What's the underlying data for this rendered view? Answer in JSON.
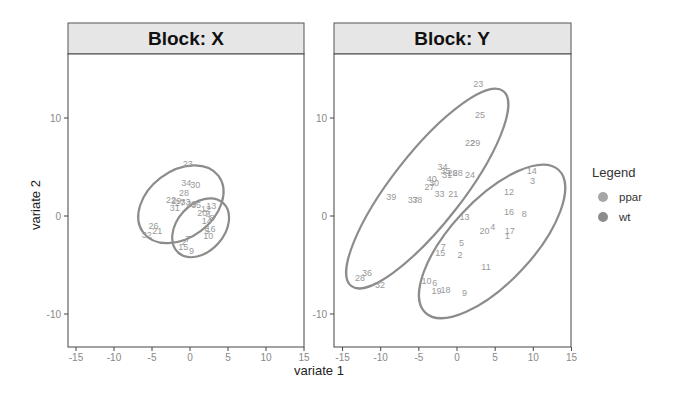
{
  "chart_data": [
    {
      "type": "scatter",
      "title": "Block: X",
      "xlabel": "variate 1",
      "ylabel": "variate 2",
      "xlim": [
        -15,
        15
      ],
      "ylim": [
        -13,
        16
      ],
      "xticks": [
        -15,
        -10,
        -5,
        0,
        5,
        10,
        15
      ],
      "yticks": [
        -10,
        0,
        10
      ],
      "grid": false,
      "series": [
        {
          "name": "ppar",
          "ellipse": {
            "cx": -1.2,
            "cy": 1.2,
            "rx": 6.2,
            "ry": 3.4,
            "angle_deg": -37
          },
          "points": [
            {
              "label": "23",
              "x": -0.3,
              "y": 5.3
            },
            {
              "label": "34",
              "x": -0.5,
              "y": 3.4
            },
            {
              "label": "30",
              "x": 0.7,
              "y": 3.2
            },
            {
              "label": "28",
              "x": -0.8,
              "y": 2.3
            },
            {
              "label": "22",
              "x": -2.5,
              "y": 1.6
            },
            {
              "label": "29",
              "x": -1.8,
              "y": 1.5
            },
            {
              "label": "27",
              "x": -1.3,
              "y": 1.3
            },
            {
              "label": "33",
              "x": -0.6,
              "y": 1.4
            },
            {
              "label": "39",
              "x": 0.2,
              "y": 1.2
            },
            {
              "label": "35",
              "x": 0.8,
              "y": 1.1
            },
            {
              "label": "31",
              "x": -2.0,
              "y": 0.8
            },
            {
              "label": "26",
              "x": -4.8,
              "y": -1.0
            },
            {
              "label": "21",
              "x": -4.3,
              "y": -1.5
            },
            {
              "label": "32",
              "x": -5.7,
              "y": -1.9
            }
          ]
        },
        {
          "name": "wt",
          "ellipse": {
            "cx": 1.4,
            "cy": -1.2,
            "rx": 4.4,
            "ry": 2.4,
            "angle_deg": -48
          },
          "points": [
            {
              "label": "13",
              "x": 2.8,
              "y": 1.0
            },
            {
              "label": "12",
              "x": 2.1,
              "y": 0.7
            },
            {
              "label": "20",
              "x": 1.6,
              "y": 0.3
            },
            {
              "label": "4",
              "x": 2.4,
              "y": 0.1
            },
            {
              "label": "8",
              "x": 2.9,
              "y": -0.2
            },
            {
              "label": "14",
              "x": 2.2,
              "y": -0.5
            },
            {
              "label": "16",
              "x": 2.7,
              "y": -1.3
            },
            {
              "label": "5",
              "x": 2.2,
              "y": -1.5
            },
            {
              "label": "10",
              "x": 2.4,
              "y": -2.0
            },
            {
              "label": "7",
              "x": -0.3,
              "y": -2.3
            },
            {
              "label": "2",
              "x": -0.8,
              "y": -2.7
            },
            {
              "label": "15",
              "x": -0.9,
              "y": -3.2
            },
            {
              "label": "9",
              "x": 0.2,
              "y": -3.6
            }
          ]
        }
      ]
    },
    {
      "type": "scatter",
      "title": "Block: Y",
      "xlabel": "variate 1",
      "ylabel": "variate 2",
      "xlim": [
        -16,
        15
      ],
      "ylim": [
        -13,
        16
      ],
      "xticks": [
        -15,
        -10,
        -5,
        0,
        5,
        10,
        15
      ],
      "yticks": [
        -10,
        0,
        10
      ],
      "grid": false,
      "series": [
        {
          "name": "ppar",
          "ellipse": {
            "cx": -3.9,
            "cy": 2.8,
            "rx": 16.2,
            "ry": 3.6,
            "angle_deg": -52
          },
          "points": [
            {
              "label": "23",
              "x": 2.8,
              "y": 13.5
            },
            {
              "label": "25",
              "x": 3.0,
              "y": 10.3
            },
            {
              "label": "22",
              "x": 1.7,
              "y": 7.5
            },
            {
              "label": "29",
              "x": 2.4,
              "y": 7.5
            },
            {
              "label": "34",
              "x": -1.9,
              "y": 5.0
            },
            {
              "label": "35",
              "x": -1.5,
              "y": 4.6
            },
            {
              "label": "26",
              "x": -0.6,
              "y": 4.4
            },
            {
              "label": "28",
              "x": 0.1,
              "y": 4.4
            },
            {
              "label": "31",
              "x": -1.3,
              "y": 4.2
            },
            {
              "label": "24",
              "x": 1.7,
              "y": 4.2
            },
            {
              "label": "40",
              "x": -3.3,
              "y": 3.8
            },
            {
              "label": "30",
              "x": -3.0,
              "y": 3.4
            },
            {
              "label": "27",
              "x": -3.6,
              "y": 3.0
            },
            {
              "label": "33",
              "x": -2.3,
              "y": 2.2
            },
            {
              "label": "21",
              "x": -0.5,
              "y": 2.2
            },
            {
              "label": "39",
              "x": -8.6,
              "y": 1.9
            },
            {
              "label": "37",
              "x": -5.8,
              "y": 1.6
            },
            {
              "label": "38",
              "x": -5.2,
              "y": 1.6
            },
            {
              "label": "36",
              "x": -11.8,
              "y": -5.8
            },
            {
              "label": "28b",
              "x": -12.7,
              "y": -6.3
            },
            {
              "label": "32",
              "x": -10.1,
              "y": -7.0
            }
          ]
        },
        {
          "name": "wt",
          "ellipse": {
            "cx": 4.6,
            "cy": -2.6,
            "rx": 12.8,
            "ry": 4.2,
            "angle_deg": -47
          },
          "points": [
            {
              "label": "14",
              "x": 9.8,
              "y": 4.6
            },
            {
              "label": "3",
              "x": 9.9,
              "y": 3.6
            },
            {
              "label": "12",
              "x": 6.8,
              "y": 2.4
            },
            {
              "label": "16",
              "x": 6.8,
              "y": 0.4
            },
            {
              "label": "8",
              "x": 8.8,
              "y": 0.2
            },
            {
              "label": "13",
              "x": 1.0,
              "y": -0.1
            },
            {
              "label": "4",
              "x": 4.7,
              "y": -1.1
            },
            {
              "label": "20",
              "x": 3.6,
              "y": -1.5
            },
            {
              "label": "17",
              "x": 6.9,
              "y": -1.5
            },
            {
              "label": "1",
              "x": 6.6,
              "y": -2.0
            },
            {
              "label": "5",
              "x": 0.6,
              "y": -2.8
            },
            {
              "label": "7",
              "x": -1.8,
              "y": -3.2
            },
            {
              "label": "15",
              "x": -2.2,
              "y": -3.8
            },
            {
              "label": "2",
              "x": 0.4,
              "y": -4.0
            },
            {
              "label": "11",
              "x": 3.8,
              "y": -5.2
            },
            {
              "label": "10",
              "x": -4.0,
              "y": -6.6
            },
            {
              "label": "6",
              "x": -2.9,
              "y": -6.8
            },
            {
              "label": "18",
              "x": -1.5,
              "y": -7.5
            },
            {
              "label": "19",
              "x": -2.7,
              "y": -7.7
            },
            {
              "label": "9",
              "x": 1.0,
              "y": -7.9
            }
          ]
        }
      ]
    }
  ],
  "panels": [
    {
      "strip_label": "Block: X"
    },
    {
      "strip_label": "Block: Y"
    }
  ],
  "axes": {
    "x_title": "variate 1",
    "y_title": "variate 2",
    "x_tick_labels": [
      "-15",
      "-10",
      "-5",
      "0",
      "5",
      "10",
      "15"
    ],
    "y_tick_labels": [
      "10",
      "0",
      "-10"
    ]
  },
  "legend": {
    "title": "Legend",
    "items": [
      {
        "label": "ppar",
        "color": "#a6a6a6"
      },
      {
        "label": "wt",
        "color": "#8c8c8c"
      }
    ]
  },
  "colors": {
    "strip_bg": "#e6e6e6",
    "ellipse": "#8c8c8c",
    "point_label": "#999999",
    "frame": "#333333"
  }
}
